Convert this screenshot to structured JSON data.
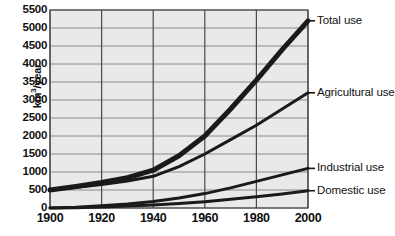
{
  "chart_data": {
    "type": "line",
    "title": "",
    "xlabel": "",
    "ylabel": "km3/year",
    "ylabel_parts": {
      "prefix": "km",
      "sup": "3",
      "suffix": "/year"
    },
    "xlim": [
      1900,
      2000
    ],
    "ylim": [
      0,
      5500
    ],
    "grid": true,
    "legend_position": "right-of-plot",
    "x_ticks": [
      1900,
      1920,
      1940,
      1960,
      1980,
      2000
    ],
    "x_tick_labels": [
      "1900",
      "1920",
      "1940",
      "1960",
      "1980",
      "2000"
    ],
    "y_ticks": [
      0,
      500,
      1000,
      1500,
      2000,
      2500,
      3000,
      3500,
      4000,
      4500,
      5000,
      5500
    ],
    "y_tick_labels": [
      "0",
      "500",
      "1000",
      "1500",
      "2000",
      "2500",
      "3000",
      "3500",
      "4000",
      "4500",
      "5000",
      "5500"
    ],
    "x": [
      1900,
      1910,
      1920,
      1930,
      1940,
      1950,
      1960,
      1970,
      1980,
      1990,
      2000
    ],
    "series": [
      {
        "name": "Total use",
        "label": "Total use",
        "color": "#1a1a1a",
        "stroke_width": 5,
        "values": [
          500,
          600,
          710,
          840,
          1050,
          1450,
          2000,
          2750,
          3550,
          4400,
          5200
        ]
      },
      {
        "name": "Agricultural use",
        "label": "Agricultural use",
        "color": "#1a1a1a",
        "stroke_width": 3,
        "values": [
          500,
          570,
          650,
          750,
          880,
          1150,
          1500,
          1900,
          2300,
          2750,
          3200
        ]
      },
      {
        "name": "Industrial use",
        "label": "Industrial use",
        "color": "#1a1a1a",
        "stroke_width": 3,
        "values": [
          0,
          20,
          60,
          110,
          180,
          280,
          400,
          560,
          740,
          920,
          1100
        ]
      },
      {
        "name": "Domestic use",
        "label": "Domestic use",
        "color": "#1a1a1a",
        "stroke_width": 3,
        "values": [
          0,
          10,
          30,
          55,
          85,
          125,
          175,
          240,
          310,
          390,
          480
        ]
      }
    ],
    "colors": {
      "plot_background": "#e9e9e9",
      "gridline": "#8a8a8a",
      "axis": "#4a4a4a",
      "text": "#111111",
      "page_background": "#ffffff"
    },
    "legend_anchor_values": {
      "Total use": 5200,
      "Agricultural use": 3200,
      "Industrial use": 1100,
      "Domestic use": 480
    }
  }
}
